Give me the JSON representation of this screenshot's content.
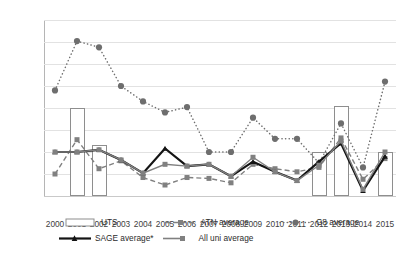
{
  "chart_data": {
    "type": "line",
    "title": "",
    "xlabel": "",
    "ylabel": "# startup companies created",
    "ylim": [
      0,
      4
    ],
    "ytick_values": [
      0,
      0.5,
      1,
      1.5,
      2,
      2.5,
      3,
      3.5,
      4
    ],
    "ytick_labels": [
      "0",
      "0.5",
      "1",
      "1.5",
      "2",
      "2.5",
      "3",
      "3.5",
      "4"
    ],
    "grid": true,
    "legend_position": "bottom",
    "categories": [
      "2000",
      "2001",
      "2002",
      "2003",
      "2004",
      "2005",
      "2006",
      "2007",
      "2008",
      "2009",
      "2010",
      "2011",
      "2012",
      "2013",
      "2014",
      "2015"
    ],
    "series": [
      {
        "name": "UTS",
        "type": "bar",
        "style": "hollow-bar",
        "color": "#8e8e8e",
        "values": [
          null,
          2.0,
          1.15,
          null,
          null,
          null,
          null,
          null,
          null,
          null,
          null,
          null,
          1.0,
          2.05,
          null,
          1.0
        ]
      },
      {
        "name": "ATN average",
        "type": "line",
        "style": "dashed",
        "marker": "square",
        "color": "#808080",
        "values": [
          0.5,
          1.28,
          0.62,
          0.8,
          0.42,
          0.25,
          0.42,
          0.4,
          0.3,
          0.72,
          0.62,
          0.55,
          0.65,
          1.32,
          0.38,
          0.85
        ]
      },
      {
        "name": "G8  average",
        "type": "line",
        "style": "dotted",
        "marker": "circle",
        "color": "#6e6e6e",
        "values": [
          2.4,
          3.52,
          3.38,
          2.5,
          2.15,
          1.9,
          2.02,
          1.0,
          1.0,
          1.78,
          1.3,
          1.3,
          0.75,
          1.65,
          0.65,
          2.6
        ]
      },
      {
        "name": "SAGE average*",
        "type": "line",
        "style": "solid",
        "marker": "triangle",
        "color": "#141414",
        "values": [
          1.0,
          1.0,
          1.05,
          0.82,
          0.52,
          1.08,
          0.68,
          0.72,
          0.45,
          0.78,
          0.55,
          0.35,
          0.78,
          1.2,
          0.12,
          0.9
        ]
      },
      {
        "name": "All uni average",
        "type": "line",
        "style": "solid-thin",
        "marker": "square",
        "color": "#808080",
        "values": [
          1.0,
          1.0,
          1.05,
          0.82,
          0.52,
          0.72,
          0.68,
          0.72,
          0.45,
          0.88,
          0.55,
          0.35,
          0.7,
          1.25,
          0.15,
          1.0
        ]
      }
    ]
  },
  "legend": {
    "rows": [
      [
        {
          "label": "UTS",
          "swatch": "hollow-bar-swatch"
        },
        {
          "label": "ATN average",
          "swatch": "dashed-square-swatch"
        },
        {
          "label": "G8  average",
          "swatch": "dotted-circle-swatch"
        }
      ],
      [
        {
          "label": "SAGE average*",
          "swatch": "solid-triangle-swatch"
        },
        {
          "label": "All uni average",
          "swatch": "solid-square-swatch"
        }
      ]
    ]
  }
}
